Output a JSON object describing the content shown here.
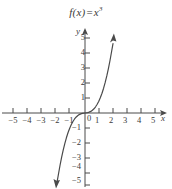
{
  "figure": {
    "title_prefix": "f(x)",
    "title_equals": "=",
    "title_base": "x",
    "title_exponent": "3",
    "title_full": "f(x) = x3",
    "axis_label_x": "x",
    "axis_label_y": "y",
    "origin_label": "0",
    "stroke_color": "#4a4a4a",
    "text_color": "#3a3a3a",
    "background_color": "#ffffff"
  },
  "chart_data": {
    "type": "line",
    "function": "y = x^3",
    "xlabel": "x",
    "ylabel": "y",
    "xlim": [
      -5.8,
      5.8
    ],
    "ylim": [
      -5.8,
      5.8
    ],
    "grid": false,
    "legend": null,
    "xticks": [
      -5,
      -4,
      -3,
      -2,
      -1,
      1,
      2,
      3,
      4,
      5
    ],
    "xtick_labels": [
      "-5",
      "-4",
      "-3",
      "-2",
      "-1",
      "1",
      "2",
      "3",
      "4",
      "5"
    ],
    "yticks": [
      5,
      4,
      3,
      2,
      1,
      -1,
      -2,
      -3,
      -4,
      -5
    ],
    "ytick_labels": [
      "5",
      "4",
      "3",
      "2",
      "1",
      "-1",
      "-2",
      "-3",
      "-4",
      "-5"
    ],
    "origin_tick_label": "0",
    "x": [
      -1.75,
      -1.6,
      -1.4,
      -1.2,
      -1.0,
      -0.8,
      -0.6,
      -0.4,
      -0.2,
      0,
      0.2,
      0.4,
      0.6,
      0.8,
      1.0,
      1.2,
      1.4,
      1.6,
      1.75
    ],
    "values": [
      -5.36,
      -4.1,
      -2.74,
      -1.73,
      -1.0,
      -0.51,
      -0.22,
      -0.06,
      -0.01,
      0,
      0.01,
      0.06,
      0.22,
      0.51,
      1.0,
      1.73,
      2.74,
      4.1,
      5.36
    ],
    "arrows": [
      "curve-start-down-left",
      "curve-end-up-right",
      "x-axis-right",
      "y-axis-up"
    ]
  },
  "x_tick_labels": [
    {
      "text": "-5",
      "px": 13
    },
    {
      "text": "-4",
      "px": 27
    },
    {
      "text": "-3",
      "px": 41
    },
    {
      "text": "-2",
      "px": 55
    },
    {
      "text": "-1",
      "px": 69
    },
    {
      "text": "1",
      "px": 97
    },
    {
      "text": "2",
      "px": 111
    },
    {
      "text": "3",
      "px": 125
    },
    {
      "text": "4",
      "px": 139
    },
    {
      "text": "5",
      "px": 153
    }
  ],
  "y_tick_labels": [
    {
      "text": "5",
      "py": 38
    },
    {
      "text": "4",
      "py": 53
    },
    {
      "text": "3",
      "py": 68
    },
    {
      "text": "2",
      "py": 83
    },
    {
      "text": "1",
      "py": 98
    },
    {
      "text": "-1",
      "py": 128
    },
    {
      "text": "-2",
      "py": 143
    },
    {
      "text": "-3",
      "py": 158
    },
    {
      "text": "-4",
      "py": 167
    },
    {
      "text": "-5",
      "py": 181
    }
  ]
}
